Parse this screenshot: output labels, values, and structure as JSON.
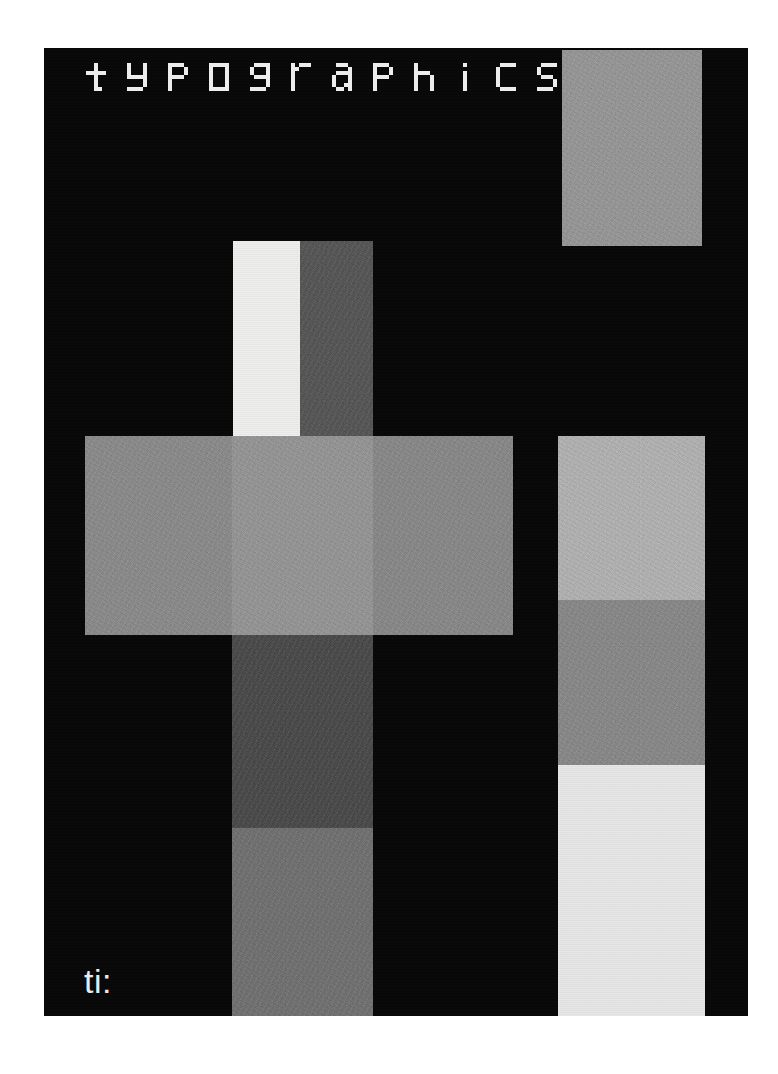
{
  "poster": {
    "title": "typographics",
    "title_letters": [
      "t",
      "y",
      "p",
      "o",
      "g",
      "r",
      "a",
      "p",
      "h",
      "i",
      "c",
      "s"
    ],
    "footer_text": "ti:",
    "background_color": "#ffffff",
    "plate_color": "#050505",
    "headline_color": "#f2f2f2",
    "footer_color": "#f0f0f0",
    "plate": {
      "x": 44,
      "y": 48,
      "width": 704,
      "height": 968
    }
  },
  "blocks": [
    {
      "id": "block-top-right",
      "name": "top-right-grey-block",
      "color": "#a0a0a0",
      "texture": "grain",
      "x": 562,
      "y": 50,
      "width": 140,
      "height": 196
    },
    {
      "id": "block-white-column",
      "name": "white-column-block",
      "color": "#f4f4f2",
      "texture": "smooth",
      "x": 233,
      "y": 241,
      "width": 67,
      "height": 196
    },
    {
      "id": "block-dark-column-top",
      "name": "dark-grey-column-upper-block",
      "color": "#4a4a4a",
      "texture": "grain",
      "x": 300,
      "y": 241,
      "width": 73,
      "height": 196
    },
    {
      "id": "block-band-left",
      "name": "center-band-left-segment",
      "color": "#909090",
      "texture": "grain",
      "x": 85,
      "y": 436,
      "width": 147,
      "height": 199
    },
    {
      "id": "block-band-middle",
      "name": "center-band-middle-segment",
      "color": "#9e9e9e",
      "texture": "grain",
      "x": 232,
      "y": 436,
      "width": 141,
      "height": 199
    },
    {
      "id": "block-band-right",
      "name": "center-band-right-segment",
      "color": "#8d8d8d",
      "texture": "grain",
      "x": 373,
      "y": 436,
      "width": 140,
      "height": 199
    },
    {
      "id": "block-right-light",
      "name": "right-column-light-block",
      "color": "#c4c4c4",
      "texture": "grain",
      "x": 558,
      "y": 436,
      "width": 147,
      "height": 164
    },
    {
      "id": "block-mid-dark",
      "name": "middle-column-dark-block",
      "color": "#3a3a3a",
      "texture": "grain",
      "x": 232,
      "y": 635,
      "width": 141,
      "height": 193
    },
    {
      "id": "block-right-medium",
      "name": "right-column-medium-block",
      "color": "#8d8d8d",
      "texture": "grain",
      "x": 558,
      "y": 600,
      "width": 147,
      "height": 165
    },
    {
      "id": "block-mid-lower",
      "name": "middle-column-lower-grey-block",
      "color": "#6e6e6e",
      "texture": "grain",
      "x": 232,
      "y": 828,
      "width": 141,
      "height": 188
    },
    {
      "id": "block-right-white",
      "name": "right-column-near-white-block",
      "color": "#ececec",
      "texture": "smooth",
      "x": 558,
      "y": 765,
      "width": 147,
      "height": 251
    }
  ],
  "headline_position": {
    "x": 86,
    "y": 63
  },
  "footer_position": {
    "x": 84,
    "y": 962,
    "font_size": 34
  }
}
